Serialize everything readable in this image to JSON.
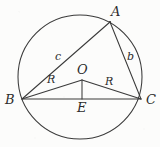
{
  "figure": {
    "background_color": "#fcfcfb",
    "stroke_color": "#3a3a3a",
    "label_color": "#2c2c2c"
  },
  "geometry": {
    "circle": {
      "cx": 80,
      "cy": 77,
      "r": 62
    },
    "points": {
      "A": {
        "x": 110,
        "y": 22
      },
      "B": {
        "x": 22,
        "y": 99
      },
      "C": {
        "x": 141,
        "y": 99
      },
      "O": {
        "x": 82,
        "y": 80
      },
      "E": {
        "x": 82,
        "y": 99
      }
    },
    "segments": [
      {
        "name": "AB",
        "from": "A",
        "to": "B"
      },
      {
        "name": "AC",
        "from": "A",
        "to": "C"
      },
      {
        "name": "BC",
        "from": "B",
        "to": "C"
      },
      {
        "name": "OB",
        "from": "O",
        "to": "B"
      },
      {
        "name": "OC",
        "from": "O",
        "to": "C"
      },
      {
        "name": "OE",
        "from": "O",
        "to": "E"
      }
    ]
  },
  "labels": {
    "vertex_a": {
      "text": "A",
      "x": 111,
      "y": 5
    },
    "vertex_b": {
      "text": "B",
      "x": 5,
      "y": 93
    },
    "vertex_c": {
      "text": "C",
      "x": 146,
      "y": 93
    },
    "center_o": {
      "text": "O",
      "x": 77,
      "y": 63
    },
    "foot_e": {
      "text": "E",
      "x": 77,
      "y": 101
    },
    "side_c": {
      "text": "c",
      "x": 55,
      "y": 51
    },
    "side_b": {
      "text": "b",
      "x": 127,
      "y": 51
    },
    "radius_left": {
      "text": "R",
      "x": 47,
      "y": 74
    },
    "radius_right": {
      "text": "R",
      "x": 105,
      "y": 76
    }
  }
}
